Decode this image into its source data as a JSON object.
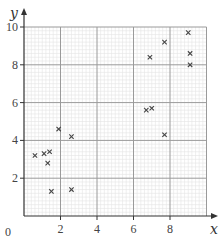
{
  "chart_data": {
    "type": "scatter",
    "title": "",
    "xlabel": "x",
    "ylabel": "y",
    "xlim": [
      0,
      10
    ],
    "ylim": [
      0,
      10
    ],
    "xticks": [
      2,
      4,
      6,
      8
    ],
    "yticks": [
      2,
      4,
      6,
      8,
      10
    ],
    "origin_label": "0",
    "grid": {
      "major_step": 2,
      "minor_step": 0.2
    },
    "marker": "x",
    "points": [
      {
        "x": 0.6,
        "y": 3.2
      },
      {
        "x": 1.1,
        "y": 3.3
      },
      {
        "x": 1.4,
        "y": 3.4
      },
      {
        "x": 1.3,
        "y": 2.8
      },
      {
        "x": 1.5,
        "y": 1.3
      },
      {
        "x": 1.9,
        "y": 4.6
      },
      {
        "x": 2.6,
        "y": 4.2
      },
      {
        "x": 2.6,
        "y": 1.4
      },
      {
        "x": 6.7,
        "y": 5.6
      },
      {
        "x": 7.0,
        "y": 5.7
      },
      {
        "x": 7.7,
        "y": 4.3
      },
      {
        "x": 6.9,
        "y": 8.4
      },
      {
        "x": 7.7,
        "y": 9.2
      },
      {
        "x": 9.0,
        "y": 9.7
      },
      {
        "x": 9.1,
        "y": 8.6
      },
      {
        "x": 9.1,
        "y": 8.0
      }
    ]
  },
  "style": {
    "major_grid_color": "#9a9a9a",
    "minor_grid_color": "#e4e4e4",
    "axis_color": "#333333",
    "marker_color": "#444444"
  }
}
